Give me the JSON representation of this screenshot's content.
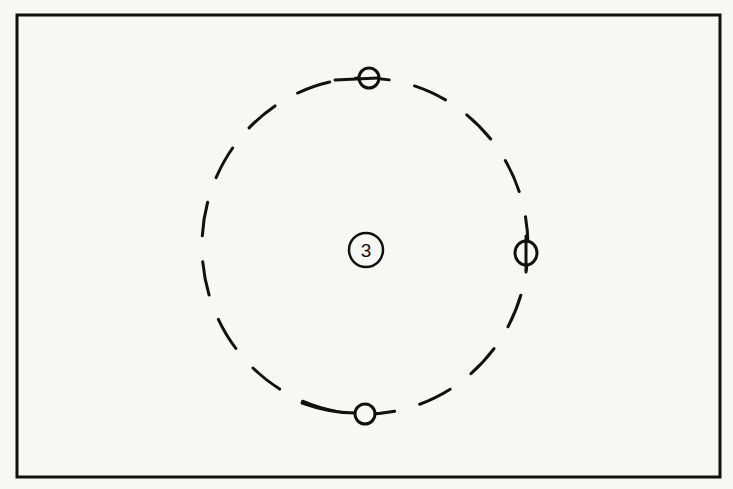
{
  "diagram": {
    "center_label": "3",
    "colors": {
      "background": "#f7f7f5",
      "stroke": "#111111"
    },
    "markers": [
      {
        "position": "top",
        "symbol": "circle-with-horizontal-bar"
      },
      {
        "position": "right",
        "symbol": "circle-with-vertical-bar"
      },
      {
        "position": "bottom",
        "symbol": "open-circle"
      }
    ]
  }
}
